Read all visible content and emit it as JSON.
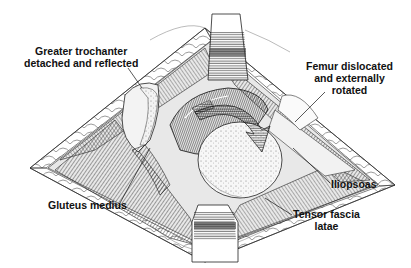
{
  "figure": {
    "type": "surgical-anatomy-illustration",
    "style": "black-and-white pen-and-ink line drawing",
    "colors": {
      "ink": "#111111",
      "background": "#ffffff",
      "shade_dark": "#3a3a3a",
      "shade_mid": "#8a8a8a",
      "shade_light": "#d9d9d9"
    },
    "arrow": {
      "description": "curved arrow indicating external rotation of femur"
    }
  },
  "labels": {
    "greater_trochanter": {
      "line1": "Greater trochanter",
      "line2": "detached and reflected"
    },
    "femur": {
      "line1": "Femur dislocated",
      "line2": "and externally",
      "line3": "rotated"
    },
    "gluteus_medius": {
      "line1": "Gluteus medius"
    },
    "iliopsoas": {
      "line1": "Iliopsoas"
    },
    "tensor_fascia_latae": {
      "line1": "Tensor fascia",
      "line2": "latae"
    }
  }
}
